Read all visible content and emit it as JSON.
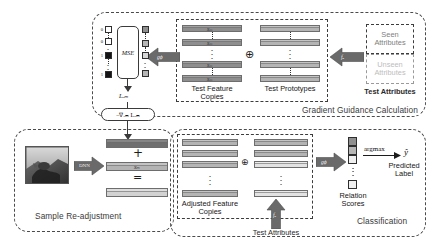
{
  "figure": {
    "type": "architecture-diagram",
    "domain": "zero-shot learning model pipeline"
  },
  "panels": {
    "gradient_guidance": {
      "title": "Gradient Guidance Calculation",
      "inner_left_caption_line1": "Test Feature",
      "inner_left_caption_line2": "Copies",
      "inner_right_caption": "Test Prototypes",
      "combine_symbol": "⊕",
      "feature_bar_label": "xₘ",
      "prototype_bar_label": "",
      "arrow_to_mse_label": "gϕ",
      "arrow_from_attributes_label": "fₐ"
    },
    "test_attributes_top": {
      "seen_label_line1": "Seen",
      "seen_label_line2": "Attributes",
      "unseen_label_line1": "Unseen",
      "unseen_label_line2": "Attributes",
      "caption": "Test Attributes"
    },
    "mse": {
      "box_label": "MSE",
      "loss_label": "Lₒₘ",
      "gradient_label": "−∇ₓₘ Lₒₘ",
      "binary_labels": [
        "0",
        "0",
        "1",
        "1"
      ],
      "binary_values": [
        "white",
        "white",
        "black",
        "black"
      ],
      "ellipsis": "⋮"
    },
    "sample_readjustment": {
      "title": "Sample Re-adjustment",
      "encoder_arrow_label": "DNN",
      "plus_symbol": "+",
      "equals_symbol": "=",
      "feature_label": "xₘ"
    },
    "classification": {
      "title": "Classification",
      "left_caption_line1": "Adjusted Feature",
      "left_caption_line2": "Copies",
      "combine_symbol": "⊕",
      "attributes_arrow_label": "fₐ",
      "attributes_caption": "Test Attributes",
      "relation_arrow_label": "gϕ",
      "relation_caption_line1": "Relation",
      "relation_caption_line2": "Scores",
      "argmax_label": "argmax",
      "prediction_symbol": "ŷ",
      "prediction_caption_line1": "Predicted",
      "prediction_caption_line2": "Label",
      "vertical_ellipsis": "⋮"
    }
  },
  "colors": {
    "panel_border": "#4a4a4a",
    "bar_dark": "#8e8e8e",
    "bar_mid": "#b4b4b4",
    "bar_light": "#d2d2d2",
    "arrow_fill": "#6a6a6a",
    "text": "#161616",
    "muted_text": "#7e7e7e",
    "background": "#ffffff"
  }
}
